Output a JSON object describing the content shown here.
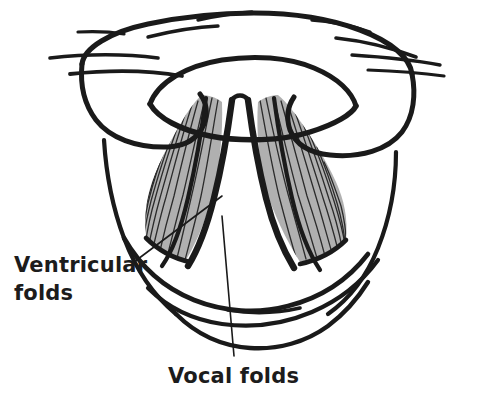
{
  "figure": {
    "background_color": "#ffffff",
    "ink_color": "#1a1a1a",
    "fold_fill_color": "#b0b0b0",
    "hatch_color": "#2b2b2b"
  },
  "labels": [
    {
      "id": "ventricular-folds",
      "line1": "Ventricular",
      "line2": "folds",
      "text_x": 14,
      "text_y_line1": 272,
      "text_y_line2": 300,
      "leader_from_x": 134,
      "leader_from_y": 262,
      "leader_to_x": 222,
      "leader_to_y": 196
    },
    {
      "id": "vocal-folds",
      "line1": "Vocal folds",
      "line2": "",
      "text_x": 168,
      "text_y_line1": 383,
      "text_y_line2": 0,
      "leader_from_x": 234,
      "leader_from_y": 356,
      "leader_to_x": 222,
      "leader_to_y": 216
    }
  ],
  "structures": [
    {
      "id": "epiglottis",
      "name": "epiglottis",
      "shading": "none"
    },
    {
      "id": "epiglottis-inner-rim",
      "name": "epiglottis inner rim",
      "shading": "none"
    },
    {
      "id": "aryepiglottic-fold-left",
      "name": "left aryepiglottic fold",
      "shading": "none"
    },
    {
      "id": "aryepiglottic-fold-right",
      "name": "right aryepiglottic fold",
      "shading": "none"
    },
    {
      "id": "ventricular-fold-left",
      "name": "left ventricular fold",
      "shading": "gray-hatched"
    },
    {
      "id": "ventricular-fold-right",
      "name": "right ventricular fold",
      "shading": "gray-hatched"
    },
    {
      "id": "vocal-fold-left",
      "name": "left vocal fold",
      "shading": "thick-outline"
    },
    {
      "id": "vocal-fold-right",
      "name": "right vocal fold",
      "shading": "thick-outline"
    },
    {
      "id": "glottis",
      "name": "glottis (rima glottidis)",
      "shading": "white"
    },
    {
      "id": "posterior-wall",
      "name": "posterior pharyngeal wall",
      "shading": "none"
    },
    {
      "id": "radiating-strokes",
      "name": "radiating tissue strokes above epiglottis",
      "count": 9
    }
  ]
}
